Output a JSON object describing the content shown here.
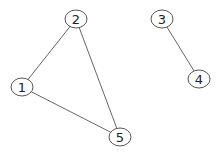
{
  "graph": {
    "nodes": [
      {
        "id": "1",
        "label": "1",
        "x": 22,
        "y": 87
      },
      {
        "id": "2",
        "label": "2",
        "x": 76,
        "y": 19
      },
      {
        "id": "3",
        "label": "3",
        "x": 162,
        "y": 19
      },
      {
        "id": "4",
        "label": "4",
        "x": 199,
        "y": 79
      },
      {
        "id": "5",
        "label": "5",
        "x": 120,
        "y": 137
      }
    ],
    "edges": [
      {
        "from": "2",
        "to": "1"
      },
      {
        "from": "2",
        "to": "5"
      },
      {
        "from": "1",
        "to": "5"
      },
      {
        "from": "3",
        "to": "4"
      }
    ],
    "node_rx": 11,
    "node_ry": 9,
    "colors": {
      "edge": "#666666",
      "node_stroke": "#555555",
      "label": "#222222",
      "background": "#ffffff"
    }
  }
}
